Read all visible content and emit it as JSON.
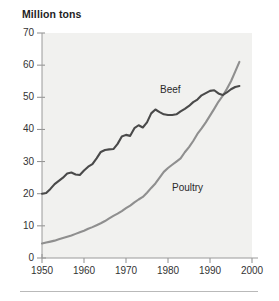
{
  "figure": {
    "axis_title": "Million tons",
    "background_color": "#ffffff",
    "plot_background_color": "#f1f1ef",
    "bottom_rule_color": "#b9b9b9"
  },
  "chart_data": {
    "type": "line",
    "title": "Million tons",
    "xlabel": "",
    "ylabel": "Million tons",
    "xlim": [
      1950,
      2000
    ],
    "ylim": [
      0,
      70
    ],
    "xticks": [
      1950,
      1960,
      1970,
      1980,
      1990,
      2000
    ],
    "yticks": [
      0,
      10,
      20,
      30,
      40,
      50,
      60,
      70
    ],
    "xtick_labels": [
      "1950",
      "1960",
      "1970",
      "1980",
      "1990",
      "2000"
    ],
    "ytick_labels": [
      "0",
      "10",
      "20",
      "30",
      "40",
      "50",
      "60",
      "70"
    ],
    "grid": false,
    "legend": "inline-annotations",
    "annotations": [
      {
        "text": "Beef",
        "x": 1978,
        "y": 52
      },
      {
        "text": "Poultry",
        "x": 1981,
        "y": 26
      }
    ],
    "series": [
      {
        "name": "Beef",
        "color": "#4a4a4a",
        "line_width": 2.1,
        "x": [
          1950,
          1951,
          1952,
          1953,
          1954,
          1955,
          1956,
          1957,
          1958,
          1959,
          1960,
          1961,
          1962,
          1963,
          1964,
          1965,
          1966,
          1967,
          1968,
          1969,
          1970,
          1971,
          1972,
          1973,
          1974,
          1975,
          1976,
          1977,
          1978,
          1979,
          1980,
          1981,
          1982,
          1983,
          1984,
          1985,
          1986,
          1987,
          1988,
          1989,
          1990,
          1991,
          1992,
          1993,
          1994,
          1995,
          1996,
          1997
        ],
        "values": [
          20.0,
          20.2,
          21.5,
          23.0,
          24.0,
          25.0,
          26.3,
          26.6,
          26.0,
          25.8,
          27.2,
          28.4,
          29.2,
          31.0,
          33.0,
          33.6,
          33.8,
          33.9,
          35.5,
          37.8,
          38.3,
          38.0,
          40.4,
          41.3,
          40.6,
          42.2,
          45.0,
          46.2,
          45.4,
          44.7,
          44.5,
          44.5,
          44.7,
          45.6,
          46.4,
          47.3,
          48.5,
          49.3,
          50.6,
          51.3,
          52.0,
          52.2,
          51.2,
          50.7,
          51.5,
          52.5,
          53.2,
          53.5
        ]
      },
      {
        "name": "Poultry",
        "color": "#8f8f8f",
        "line_width": 2.1,
        "x": [
          1950,
          1951,
          1952,
          1953,
          1954,
          1955,
          1956,
          1957,
          1958,
          1959,
          1960,
          1961,
          1962,
          1963,
          1964,
          1965,
          1966,
          1967,
          1968,
          1969,
          1970,
          1971,
          1972,
          1973,
          1974,
          1975,
          1976,
          1977,
          1978,
          1979,
          1980,
          1981,
          1982,
          1983,
          1984,
          1985,
          1986,
          1987,
          1988,
          1989,
          1990,
          1991,
          1992,
          1993,
          1994,
          1995,
          1996,
          1997
        ],
        "values": [
          4.5,
          4.8,
          5.1,
          5.4,
          5.8,
          6.2,
          6.6,
          7.0,
          7.5,
          8.0,
          8.5,
          9.1,
          9.6,
          10.2,
          10.8,
          11.5,
          12.3,
          13.1,
          13.8,
          14.6,
          15.5,
          16.3,
          17.3,
          18.2,
          19.0,
          20.3,
          21.8,
          23.2,
          25.0,
          26.8,
          28.0,
          29.0,
          30.0,
          31.0,
          32.9,
          34.5,
          36.4,
          38.6,
          40.3,
          42.2,
          44.3,
          46.4,
          48.6,
          50.4,
          52.6,
          55.0,
          58.0,
          61.0
        ]
      }
    ]
  },
  "axes": {
    "y_labels": [
      "70",
      "60",
      "50",
      "40",
      "30",
      "20",
      "10",
      "0"
    ],
    "x_labels": [
      "1950",
      "1960",
      "1970",
      "1980",
      "1990",
      "2000"
    ]
  }
}
